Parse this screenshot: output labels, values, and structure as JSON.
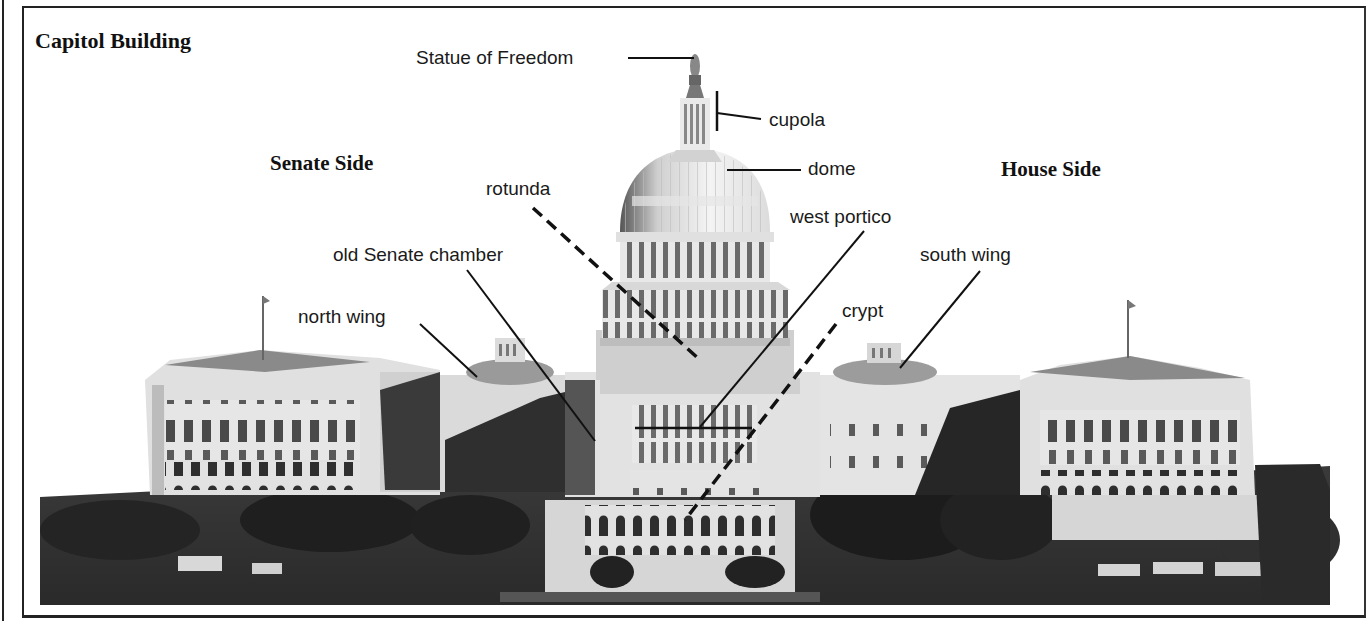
{
  "figure": {
    "title": "Capitol Building",
    "sides": {
      "senate": "Senate Side",
      "house": "House Side"
    },
    "labels": {
      "statue": "Statue of Freedom",
      "cupola": "cupola",
      "dome": "dome",
      "rotunda": "rotunda",
      "west_portico": "west portico",
      "old_senate_chamber": "old Senate chamber",
      "south_wing": "south wing",
      "north_wing": "north wing",
      "crypt": "crypt"
    },
    "leader_styles": {
      "solid": [
        "Statue of Freedom",
        "cupola",
        "dome",
        "west portico",
        "old Senate chamber",
        "south wing",
        "north wing"
      ],
      "dashed": [
        "rotunda",
        "crypt"
      ]
    },
    "colors": {
      "ink": "#1a1a1a",
      "paper": "#ffffff",
      "stone": "#d8d8d8",
      "shadow": "#3a3a3a",
      "trees": "#2b2b2b"
    }
  }
}
